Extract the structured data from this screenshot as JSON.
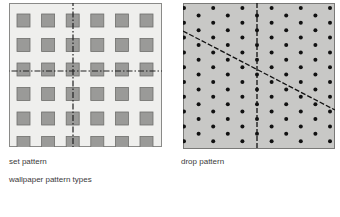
{
  "figure": {
    "set_pattern": {
      "caption": "set pattern",
      "rows": 6,
      "cols": 6,
      "background": "#efefed",
      "motif_color": "#9a9a98",
      "motif_border": "#6e6e6c",
      "motif": "square"
    },
    "drop_pattern": {
      "caption": "drop pattern",
      "background": "#c8c8c6",
      "motif_color": "#111111",
      "motif": "dot"
    },
    "title": "wallpaper pattern types"
  }
}
